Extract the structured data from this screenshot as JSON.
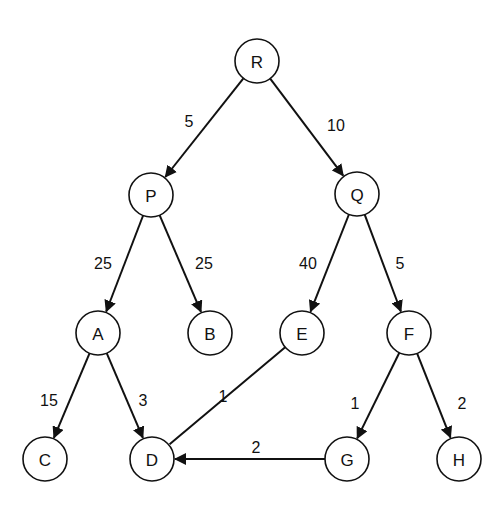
{
  "diagram": {
    "type": "weighted-directed-tree",
    "node_radius": 22,
    "nodes": [
      {
        "id": "R",
        "label": "R",
        "x": 257,
        "y": 61
      },
      {
        "id": "P",
        "label": "P",
        "x": 151,
        "y": 195
      },
      {
        "id": "Q",
        "label": "Q",
        "x": 357,
        "y": 194
      },
      {
        "id": "A",
        "label": "A",
        "x": 98,
        "y": 333
      },
      {
        "id": "B",
        "label": "B",
        "x": 210,
        "y": 333
      },
      {
        "id": "E",
        "label": "E",
        "x": 302,
        "y": 333
      },
      {
        "id": "F",
        "label": "F",
        "x": 409,
        "y": 333
      },
      {
        "id": "C",
        "label": "C",
        "x": 45,
        "y": 459
      },
      {
        "id": "D",
        "label": "D",
        "x": 152,
        "y": 459
      },
      {
        "id": "G",
        "label": "G",
        "x": 347,
        "y": 459
      },
      {
        "id": "H",
        "label": "H",
        "x": 459,
        "y": 459
      }
    ],
    "edges": [
      {
        "from": "R",
        "to": "P",
        "weight": "5",
        "arrow": true,
        "label_x": 189,
        "label_y": 121
      },
      {
        "from": "R",
        "to": "Q",
        "weight": "10",
        "arrow": true,
        "label_x": 336,
        "label_y": 125
      },
      {
        "from": "P",
        "to": "A",
        "weight": "25",
        "arrow": true,
        "label_x": 103,
        "label_y": 263
      },
      {
        "from": "P",
        "to": "B",
        "weight": "25",
        "arrow": true,
        "label_x": 204,
        "label_y": 263
      },
      {
        "from": "Q",
        "to": "E",
        "weight": "40",
        "arrow": true,
        "label_x": 308,
        "label_y": 263
      },
      {
        "from": "Q",
        "to": "F",
        "weight": "5",
        "arrow": true,
        "label_x": 400,
        "label_y": 263
      },
      {
        "from": "A",
        "to": "C",
        "weight": "15",
        "arrow": true,
        "label_x": 49,
        "label_y": 400
      },
      {
        "from": "A",
        "to": "D",
        "weight": "3",
        "arrow": true,
        "label_x": 143,
        "label_y": 400
      },
      {
        "from": "E",
        "to": "D",
        "weight": "1",
        "arrow": false,
        "label_x": 223,
        "label_y": 396
      },
      {
        "from": "F",
        "to": "G",
        "weight": "1",
        "arrow": true,
        "label_x": 355,
        "label_y": 403
      },
      {
        "from": "F",
        "to": "H",
        "weight": "2",
        "arrow": true,
        "label_x": 462,
        "label_y": 403
      },
      {
        "from": "G",
        "to": "D",
        "weight": "2",
        "arrow": true,
        "label_x": 256,
        "label_y": 447
      }
    ],
    "colors": {
      "stroke": "#111111",
      "fill": "#ffffff",
      "background": "#ffffff"
    }
  }
}
